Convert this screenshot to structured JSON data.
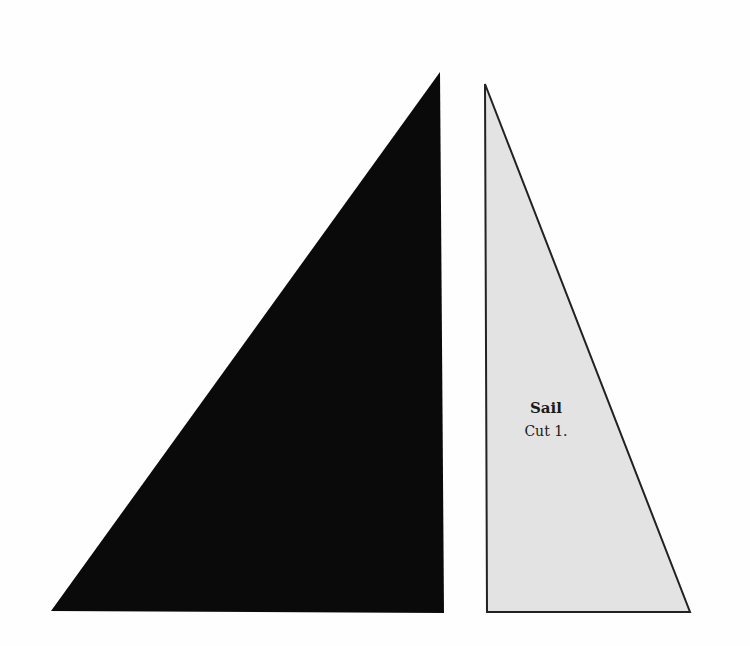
{
  "pattern": {
    "pieces": [
      {
        "name": "dark-triangle",
        "fill": "#0a0a0a",
        "points": "440,72 444,613 51,611"
      },
      {
        "name": "sail",
        "fill": "#e3e3e3",
        "stroke": "#222222",
        "points": "485,84 690,612 487,612",
        "title": "Sail",
        "instruction": "Cut 1."
      }
    ]
  }
}
